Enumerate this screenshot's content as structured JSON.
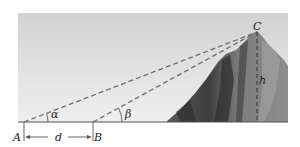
{
  "figure": {
    "labels": {
      "point_a": "A",
      "point_b": "B",
      "point_c": "C",
      "distance": "d",
      "height": "h",
      "angle_alpha": "α",
      "angle_beta": "β"
    },
    "colors": {
      "sky_top": "#d4d4d4",
      "sky_bottom": "#ececec",
      "dashed_line": "#6e6e6e",
      "ground_line": "#555555",
      "rock_dark": "#4a4a4a",
      "rock_light": "#9a9a9a"
    }
  }
}
